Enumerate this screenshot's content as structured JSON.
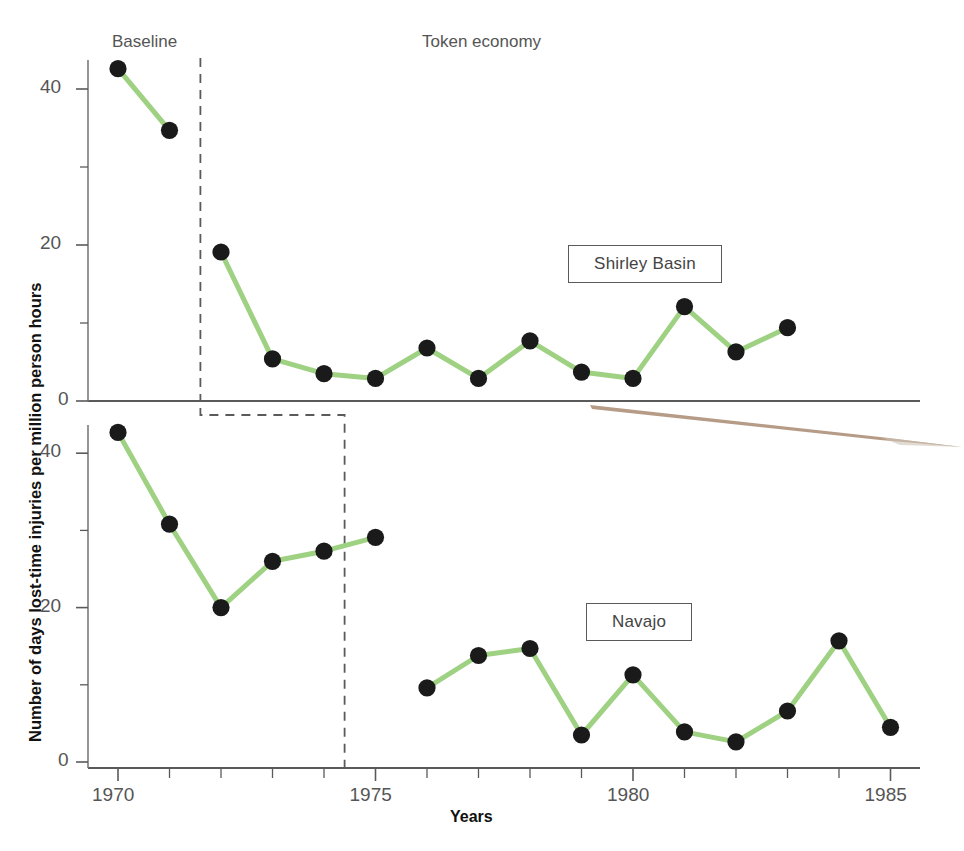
{
  "chart_data": {
    "type": "line",
    "title": "",
    "xlabel": "Years",
    "ylabel": "Number of days lost-time injuries per million person hours",
    "xlim": [
      1969.4,
      1985.6
    ],
    "xticks": [
      1970,
      1975,
      1980,
      1985
    ],
    "xtick_labels": [
      "1970",
      "1975",
      "1980",
      "1985"
    ],
    "minor_xticks": [
      1971,
      1972,
      1973,
      1974,
      1976,
      1977,
      1978,
      1979,
      1981,
      1982,
      1983,
      1984
    ],
    "grid": false,
    "legend_position": "inline-box",
    "phase_annotations": [
      {
        "label": "Baseline",
        "x": 1972.0,
        "panel": "both"
      },
      {
        "label": "Token economy",
        "x": 1978.8,
        "panel": "both"
      }
    ],
    "panels": [
      {
        "name": "Shirley Basin",
        "label": "Shirley Basin",
        "ylim": [
          0,
          45
        ],
        "yticks": [
          0,
          20,
          40
        ],
        "ytick_labels": [
          "0",
          "20",
          "40"
        ],
        "minor_yticks": [
          10,
          30
        ],
        "baseline_end_year": 1971.6,
        "x": [
          1970,
          1971,
          1972,
          1973,
          1974,
          1975,
          1976,
          1977,
          1978,
          1979,
          1980,
          1981,
          1982,
          1983
        ],
        "y": [
          42.6,
          34.7,
          19.1,
          5.4,
          3.5,
          2.9,
          6.8,
          2.9,
          7.7,
          3.7,
          2.9,
          12.1,
          6.3,
          9.4
        ]
      },
      {
        "name": "Navajo",
        "label": "Navajo",
        "ylim": [
          0,
          45
        ],
        "yticks": [
          0,
          20,
          40
        ],
        "ytick_labels": [
          "0",
          "20",
          "40"
        ],
        "minor_yticks": [
          10,
          30
        ],
        "baseline_end_year": 1974.4,
        "x": [
          1970,
          1971,
          1972,
          1973,
          1974,
          1975,
          1976,
          1977,
          1978,
          1979,
          1980,
          1981,
          1982,
          1983,
          1984,
          1985
        ],
        "y": [
          42.7,
          30.8,
          20.0,
          26.0,
          27.3,
          29.1,
          9.6,
          13.8,
          14.7,
          3.5,
          11.3,
          3.9,
          2.6,
          6.6,
          15.7,
          4.5
        ]
      }
    ],
    "colors": {
      "line": "#9ed182",
      "marker": "#1a1a1a",
      "axis": "#5a5a5a",
      "dashed": "#5a5a5a",
      "text": "#4a4a4a",
      "smudge": "#a98a72"
    }
  }
}
